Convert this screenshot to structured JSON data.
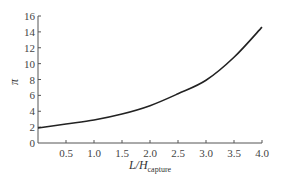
{
  "chart_data": {
    "type": "line",
    "title": "",
    "xlabel": "L/H_capture",
    "xlabel_main": "L/H",
    "xlabel_sub": "capture",
    "ylabel": "π",
    "xlim": [
      0,
      4.0
    ],
    "ylim": [
      0,
      16
    ],
    "grid": false,
    "legend": null,
    "x_ticks": [
      "0.5",
      "1.0",
      "1.5",
      "2.0",
      "2.5",
      "3.0",
      "3.5",
      "4.0"
    ],
    "y_ticks": [
      "0",
      "2",
      "4",
      "6",
      "8",
      "10",
      "12",
      "14",
      "16"
    ],
    "series": [
      {
        "name": "π",
        "color": "#222222",
        "x": [
          0,
          0.5,
          1.0,
          1.5,
          2.0,
          2.5,
          3.0,
          3.5,
          4.0
        ],
        "y": [
          1.9,
          2.4,
          2.9,
          3.65,
          4.7,
          6.2,
          7.9,
          10.8,
          14.6
        ]
      }
    ]
  }
}
